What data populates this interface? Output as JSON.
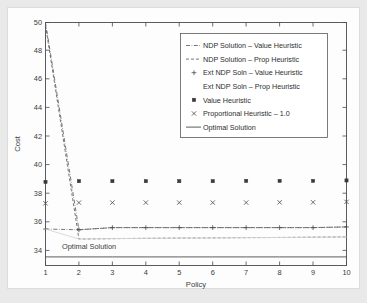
{
  "chart_data": {
    "type": "line",
    "title": "",
    "xlabel": "Policy",
    "ylabel": "Cost",
    "xlim": [
      1,
      10
    ],
    "ylim": [
      33.0,
      50.0
    ],
    "xticks": [
      1,
      2,
      3,
      4,
      5,
      6,
      7,
      8,
      9,
      10
    ],
    "yticks": [
      34,
      36,
      38,
      40,
      42,
      44,
      46,
      48,
      50
    ],
    "xticklabels": [
      "1",
      "2",
      "3",
      "4",
      "5",
      "6",
      "7",
      "8",
      "9",
      "10"
    ],
    "yticklabels": [
      "34",
      "36",
      "38",
      "40",
      "42",
      "44",
      "46",
      "48",
      "50"
    ],
    "grid": false,
    "x": [
      1,
      2,
      3,
      4,
      5,
      6,
      7,
      8,
      9,
      10
    ],
    "series": [
      {
        "name": "NDP Solution – Value Heuristic",
        "style": "dash-dot",
        "marker": "none",
        "values": [
          50.0,
          35.5,
          35.65,
          35.65,
          35.65,
          35.65,
          35.65,
          35.65,
          35.65,
          35.7
        ]
      },
      {
        "name": "NDP Solution – Prop Heuristic",
        "style": "dashed",
        "marker": "none",
        "values": [
          49.8,
          34.85,
          34.88,
          34.9,
          34.92,
          34.93,
          34.95,
          34.96,
          34.98,
          35.0
        ]
      },
      {
        "name": "Ext NDP Soln – Value Heuristic",
        "style": "dash-dot",
        "marker": "plus",
        "values": [
          35.55,
          35.5,
          35.65,
          35.65,
          35.65,
          35.65,
          35.65,
          35.65,
          35.65,
          35.7
        ]
      },
      {
        "name": "Ext NDP Soln – Prop Heuristic",
        "style": "faint-solid",
        "marker": "none",
        "values": [
          35.55,
          34.85,
          34.88,
          34.9,
          34.92,
          34.93,
          34.95,
          34.96,
          34.98,
          35.0
        ]
      },
      {
        "name": "Value Heuristic",
        "style": "none",
        "marker": "square",
        "values": [
          38.85,
          38.9,
          38.9,
          38.9,
          38.9,
          38.9,
          38.92,
          38.92,
          38.92,
          38.95
        ]
      },
      {
        "name": "Proportional Heuristic – 1.0",
        "style": "none",
        "marker": "cross",
        "values": [
          37.35,
          37.4,
          37.4,
          37.4,
          37.4,
          37.4,
          37.4,
          37.42,
          37.42,
          37.45
        ]
      },
      {
        "name": "Optimal Solution",
        "style": "solid",
        "marker": "none",
        "values": [
          33.6,
          33.6,
          33.6,
          33.6,
          33.6,
          33.6,
          33.6,
          33.6,
          33.6,
          33.6
        ]
      }
    ],
    "annotations": [
      {
        "text": "Optimal Solution",
        "x": 1.45,
        "y": 34.1
      }
    ],
    "legend": {
      "position": "upper-right-inside",
      "entries": [
        {
          "label": "NDP Solution – Value Heuristic",
          "glyph": "dash-dot"
        },
        {
          "label": "NDP Solution – Prop Heuristic",
          "glyph": "dashed"
        },
        {
          "label": "Ext NDP Soln – Value Heuristic",
          "glyph": "plus"
        },
        {
          "label": "Ext NDP Soln – Prop Heuristic",
          "glyph": "blank"
        },
        {
          "label": "Value Heuristic",
          "glyph": "square"
        },
        {
          "label": "Proportional Heuristic – 1.0",
          "glyph": "cross"
        },
        {
          "label": "Optimal Solution",
          "glyph": "solid"
        }
      ]
    },
    "colors": {
      "axis": "#4a4a4a",
      "series": "#5f5f5f",
      "marker": "#3a3a3a",
      "background": "#fdfdfd",
      "page": "#e9e9e9"
    }
  }
}
